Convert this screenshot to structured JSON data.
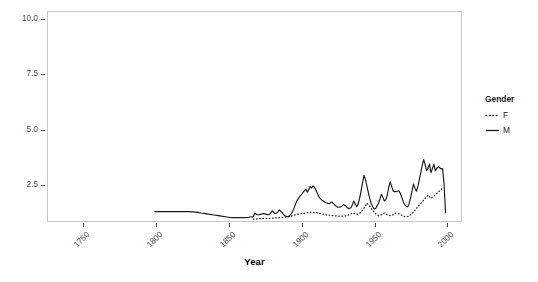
{
  "chart_data": {
    "type": "line",
    "title": "",
    "xlabel": "Year",
    "ylabel": "5−Year Average",
    "xlim": [
      1725,
      2010
    ],
    "ylim": [
      0.85,
      10.35
    ],
    "grid": false,
    "legend_position": "right",
    "legend_title": "Gender",
    "x_ticks": [
      1750,
      1800,
      1850,
      1900,
      1950,
      2000
    ],
    "x_tick_labels": [
      "1750",
      "1800",
      "1850",
      "1900",
      "1950",
      "2000"
    ],
    "y_ticks": [
      2.5,
      5.0,
      7.5,
      10.0
    ],
    "y_tick_labels": [
      "2.5",
      "5.0",
      "7.5",
      "10.0"
    ],
    "series": [
      {
        "name": "M",
        "style": "solid",
        "color": "#1a1a1a",
        "x": [
          1798,
          1800,
          1805,
          1810,
          1815,
          1820,
          1822,
          1825,
          1828,
          1830,
          1833,
          1836,
          1839,
          1842,
          1845,
          1848,
          1850,
          1852,
          1854,
          1856,
          1858,
          1860,
          1862,
          1864,
          1866,
          1867,
          1868,
          1869,
          1870,
          1871,
          1872,
          1873,
          1874,
          1875,
          1876,
          1877,
          1878,
          1879,
          1880,
          1881,
          1882,
          1883,
          1884,
          1885,
          1886,
          1887,
          1888,
          1889,
          1890,
          1891,
          1892,
          1893,
          1894,
          1895,
          1896,
          1897,
          1898,
          1899,
          1900,
          1901,
          1902,
          1903,
          1904,
          1905,
          1906,
          1907,
          1908,
          1909,
          1910,
          1911,
          1912,
          1913,
          1914,
          1915,
          1916,
          1917,
          1918,
          1919,
          1920,
          1921,
          1922,
          1923,
          1924,
          1925,
          1926,
          1927,
          1928,
          1929,
          1930,
          1931,
          1932,
          1933,
          1934,
          1935,
          1936,
          1937,
          1938,
          1939,
          1940,
          1941,
          1942,
          1943,
          1944,
          1945,
          1946,
          1947,
          1948,
          1949,
          1950,
          1951,
          1952,
          1953,
          1954,
          1955,
          1956,
          1957,
          1958,
          1959,
          1960,
          1961,
          1962,
          1963,
          1964,
          1965,
          1966,
          1967,
          1968,
          1969,
          1970,
          1971,
          1972,
          1973,
          1974,
          1975,
          1976,
          1977,
          1978,
          1979,
          1980,
          1981,
          1982,
          1983,
          1984,
          1985,
          1986,
          1987,
          1988,
          1989,
          1990,
          1991,
          1992,
          1993,
          1994,
          1995,
          1996,
          1997,
          1998
        ],
        "y": [
          1.36,
          1.36,
          1.36,
          1.36,
          1.36,
          1.36,
          1.36,
          1.35,
          1.33,
          1.3,
          1.27,
          1.24,
          1.21,
          1.18,
          1.15,
          1.12,
          1.1,
          1.09,
          1.09,
          1.09,
          1.09,
          1.09,
          1.1,
          1.12,
          1.14,
          1.3,
          1.24,
          1.22,
          1.22,
          1.24,
          1.26,
          1.28,
          1.26,
          1.24,
          1.22,
          1.24,
          1.3,
          1.4,
          1.32,
          1.28,
          1.3,
          1.36,
          1.44,
          1.36,
          1.3,
          1.22,
          1.16,
          1.14,
          1.14,
          1.18,
          1.26,
          1.38,
          1.52,
          1.7,
          1.86,
          1.96,
          2.06,
          2.12,
          2.22,
          2.3,
          2.38,
          2.24,
          2.34,
          2.5,
          2.42,
          2.52,
          2.46,
          2.32,
          2.18,
          2.04,
          1.94,
          1.88,
          1.84,
          1.8,
          1.76,
          1.74,
          1.72,
          1.76,
          1.8,
          1.72,
          1.66,
          1.6,
          1.56,
          1.56,
          1.58,
          1.62,
          1.68,
          1.64,
          1.58,
          1.52,
          1.5,
          1.54,
          1.66,
          1.84,
          1.7,
          1.58,
          1.7,
          1.96,
          2.3,
          2.66,
          3.0,
          2.8,
          2.52,
          2.22,
          1.94,
          1.72,
          1.58,
          1.48,
          1.5,
          1.62,
          1.74,
          1.94,
          2.14,
          2.0,
          1.84,
          1.9,
          2.1,
          2.46,
          2.7,
          2.5,
          2.3,
          2.26,
          2.26,
          2.28,
          2.3,
          2.18,
          2.0,
          1.8,
          1.68,
          1.6,
          1.58,
          1.72,
          1.98,
          2.3,
          2.6,
          2.42,
          2.28,
          2.48,
          2.8,
          3.12,
          3.44,
          3.7,
          3.48,
          3.2,
          3.32,
          3.5,
          3.12,
          3.3,
          3.5,
          3.2,
          3.32,
          3.38,
          3.34,
          3.28,
          3.3,
          2.6,
          1.3
        ]
      },
      {
        "name": "F",
        "style": "dotted",
        "color": "#1a1a1a",
        "x": [
          1866,
          1868,
          1870,
          1872,
          1874,
          1876,
          1878,
          1880,
          1882,
          1884,
          1886,
          1888,
          1890,
          1892,
          1894,
          1896,
          1898,
          1900,
          1902,
          1904,
          1906,
          1908,
          1910,
          1912,
          1914,
          1916,
          1918,
          1920,
          1922,
          1924,
          1926,
          1928,
          1930,
          1932,
          1934,
          1936,
          1938,
          1940,
          1942,
          1944,
          1946,
          1948,
          1950,
          1952,
          1954,
          1956,
          1958,
          1960,
          1962,
          1964,
          1966,
          1968,
          1970,
          1972,
          1974,
          1976,
          1978,
          1980,
          1982,
          1984,
          1986,
          1988,
          1990,
          1992,
          1994,
          1996
        ],
        "y": [
          1.02,
          1.03,
          1.04,
          1.05,
          1.05,
          1.06,
          1.06,
          1.07,
          1.08,
          1.09,
          1.1,
          1.11,
          1.13,
          1.16,
          1.2,
          1.24,
          1.26,
          1.28,
          1.3,
          1.32,
          1.34,
          1.33,
          1.31,
          1.28,
          1.25,
          1.22,
          1.2,
          1.19,
          1.18,
          1.16,
          1.15,
          1.16,
          1.18,
          1.22,
          1.3,
          1.26,
          1.24,
          1.34,
          1.52,
          1.74,
          1.6,
          1.42,
          1.26,
          1.18,
          1.22,
          1.3,
          1.22,
          1.18,
          1.22,
          1.3,
          1.26,
          1.2,
          1.14,
          1.14,
          1.22,
          1.34,
          1.5,
          1.66,
          1.8,
          1.96,
          2.1,
          1.96,
          2.06,
          2.18,
          2.3,
          2.42
        ]
      }
    ]
  }
}
